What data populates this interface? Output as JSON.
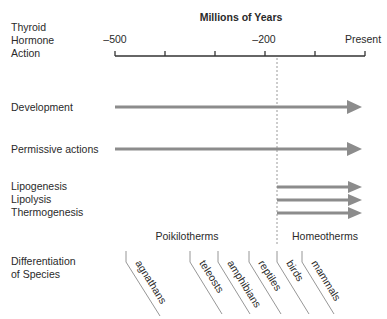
{
  "diagram": {
    "row_header": [
      "Thyroid",
      "Hormone",
      "Action"
    ],
    "axis": {
      "title": "Millions of Years",
      "tick_labels": [
        "–500",
        "–200",
        "Present"
      ],
      "tick_count": 6
    },
    "actions": [
      {
        "label": "Development",
        "start": "–500",
        "end": "Present"
      },
      {
        "label": "Permissive actions",
        "start": "–500",
        "end": "Present"
      },
      {
        "label": "Lipogenesis",
        "start": "~–180",
        "end": "Present"
      },
      {
        "label": "Lipolysis",
        "start": "~–180",
        "end": "Present"
      },
      {
        "label": "Thermogenesis",
        "start": "~–180",
        "end": "Present"
      }
    ],
    "groups": {
      "left": "Poikilotherms",
      "right": "Homeotherms"
    },
    "species_header": [
      "Differentiation",
      "of Species"
    ],
    "species": [
      "agnathans",
      "teleosts",
      "amphibians",
      "reptiles",
      "birds",
      "mammals"
    ],
    "colors": {
      "arrow": "#8c8c8c",
      "axis": "#333333",
      "text": "#2a2a2a"
    }
  }
}
